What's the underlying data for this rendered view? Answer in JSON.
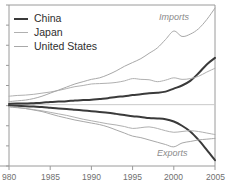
{
  "chart_data": {
    "type": "line",
    "title": "",
    "subtitle": "",
    "xlabel": "",
    "ylabel": "",
    "xlim": [
      1980,
      2005
    ],
    "ylim": [
      -1.6,
      2.6
    ],
    "grid": false,
    "zero_line": true,
    "legend_position": "top-left",
    "x": [
      1980,
      1981,
      1982,
      1983,
      1984,
      1985,
      1986,
      1987,
      1988,
      1989,
      1990,
      1991,
      1992,
      1993,
      1994,
      1995,
      1996,
      1997,
      1998,
      1999,
      2000,
      2001,
      2002,
      2003,
      2004,
      2005
    ],
    "xticks": [
      1980,
      1985,
      1990,
      1995,
      2000,
      2005
    ],
    "xticklabels": [
      "980",
      "1985",
      "1990",
      "1995",
      "2000",
      "2005"
    ],
    "annotations": [
      {
        "text": "Imports",
        "x": 2001.5,
        "y": 2.35
      },
      {
        "text": "Exports",
        "x": 2001.0,
        "y": -1.25
      }
    ],
    "series": [
      {
        "name": "China",
        "panel": "imports",
        "color": "#3a3a3a",
        "width": 2,
        "values": [
          0.02,
          0.03,
          0.03,
          0.04,
          0.05,
          0.07,
          0.08,
          0.09,
          0.11,
          0.12,
          0.13,
          0.15,
          0.17,
          0.2,
          0.22,
          0.25,
          0.27,
          0.3,
          0.31,
          0.34,
          0.42,
          0.5,
          0.62,
          0.82,
          1.05,
          1.22
        ]
      },
      {
        "name": "Japan",
        "panel": "imports",
        "color": "#b0b0b0",
        "width": 1,
        "values": [
          0.22,
          0.24,
          0.25,
          0.27,
          0.3,
          0.33,
          0.37,
          0.42,
          0.47,
          0.5,
          0.54,
          0.55,
          0.56,
          0.58,
          0.62,
          0.68,
          0.66,
          0.65,
          0.6,
          0.64,
          0.7,
          0.66,
          0.68,
          0.74,
          0.85,
          0.95
        ]
      },
      {
        "name": "United States",
        "panel": "imports",
        "color": "#a8a8a8",
        "width": 1,
        "values": [
          0.08,
          0.1,
          0.12,
          0.16,
          0.22,
          0.3,
          0.38,
          0.46,
          0.54,
          0.6,
          0.66,
          0.7,
          0.78,
          0.88,
          1.0,
          1.1,
          1.2,
          1.34,
          1.48,
          1.7,
          1.92,
          1.78,
          1.84,
          1.98,
          2.22,
          2.52
        ]
      },
      {
        "name": "China",
        "panel": "exports",
        "color": "#3a3a3a",
        "width": 2,
        "values": [
          -0.02,
          -0.03,
          -0.04,
          -0.05,
          -0.06,
          -0.08,
          -0.1,
          -0.11,
          -0.13,
          -0.15,
          -0.17,
          -0.19,
          -0.21,
          -0.24,
          -0.27,
          -0.3,
          -0.32,
          -0.35,
          -0.36,
          -0.38,
          -0.44,
          -0.55,
          -0.7,
          -0.92,
          -1.18,
          -1.45
        ]
      },
      {
        "name": "Japan",
        "panel": "exports",
        "color": "#b0b0b0",
        "width": 1,
        "values": [
          -0.06,
          -0.08,
          -0.1,
          -0.13,
          -0.16,
          -0.2,
          -0.24,
          -0.28,
          -0.33,
          -0.38,
          -0.42,
          -0.46,
          -0.5,
          -0.53,
          -0.57,
          -0.62,
          -0.6,
          -0.58,
          -0.62,
          -0.68,
          -0.72,
          -0.7,
          -0.68,
          -0.7,
          -0.74,
          -0.78
        ]
      },
      {
        "name": "United States",
        "panel": "exports",
        "color": "#a8a8a8",
        "width": 1,
        "values": [
          -0.05,
          -0.07,
          -0.1,
          -0.14,
          -0.18,
          -0.24,
          -0.3,
          -0.35,
          -0.4,
          -0.44,
          -0.48,
          -0.52,
          -0.58,
          -0.66,
          -0.74,
          -0.82,
          -0.86,
          -0.92,
          -0.98,
          -1.04,
          -1.1,
          -1.0,
          -0.96,
          -0.92,
          -0.9,
          -0.88
        ]
      }
    ]
  },
  "legend": {
    "items": [
      {
        "label": "China",
        "key": "china"
      },
      {
        "label": "Japan",
        "key": "japan"
      },
      {
        "label": "United States",
        "key": "us"
      }
    ]
  },
  "colors": {
    "china": "#3a3a3a",
    "japan": "#b0b0b0",
    "united_states": "#a8a8a8",
    "axis": "#9a9a9a",
    "zero_line": "#c9c9c9",
    "tick_text": "#6f6f6f",
    "annotation": "#8a8a8a"
  }
}
